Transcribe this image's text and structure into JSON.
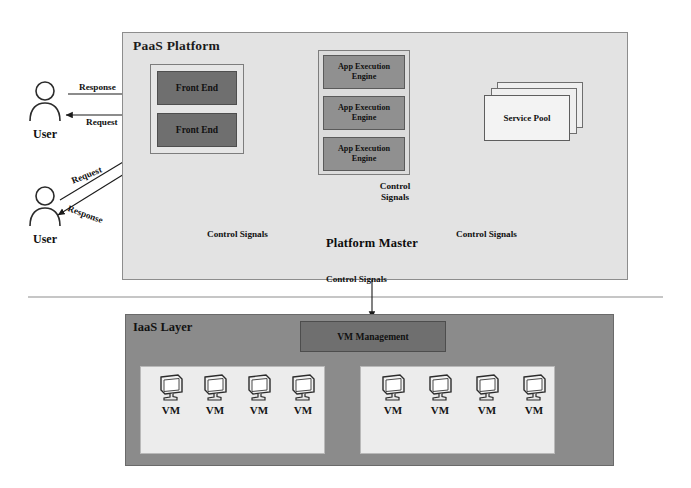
{
  "diagram": {
    "paas": {
      "title": "PaaS Platform",
      "front_end": {
        "boxes": [
          "Front End",
          "Front End"
        ]
      },
      "app_execution": {
        "boxes": [
          "App Execution Engine",
          "App Execution Engine",
          "App Execution Engine"
        ]
      },
      "service_pool": {
        "label": "Service Pool",
        "stack_count": 3
      },
      "platform_master": {
        "label": "Platform Master",
        "shape": "hexagon"
      }
    },
    "iaas": {
      "title": "IaaS Layer",
      "vm_management": "VM Management",
      "vm_group_left": [
        "VM",
        "VM",
        "VM",
        "VM"
      ],
      "vm_group_right": [
        "VM",
        "VM",
        "VM",
        "VM"
      ]
    },
    "actors": [
      {
        "name": "User",
        "messages": {
          "out": "Response",
          "in": "Request"
        }
      },
      {
        "name": "User",
        "messages": {
          "out": "Request",
          "in": "Response"
        }
      }
    ],
    "edge_labels": {
      "user1_response": "Response",
      "user1_request": "Request",
      "user2_request": "Request",
      "user2_response": "Response",
      "control_left": "Control Signals",
      "control_right": "Control Signals",
      "control_up": "Control Signals",
      "control_down": "Control Signals"
    },
    "colors": {
      "paas_bg": "#e3e3e3",
      "iaas_bg": "#8b8b8b",
      "front_end": "#6f6f6f",
      "app_engine": "#909090",
      "service_pool": "#f3f3f3",
      "platform_master": "#6f6f6f",
      "vm_group": "#ececec",
      "stroke": "#1b1b1b"
    }
  }
}
